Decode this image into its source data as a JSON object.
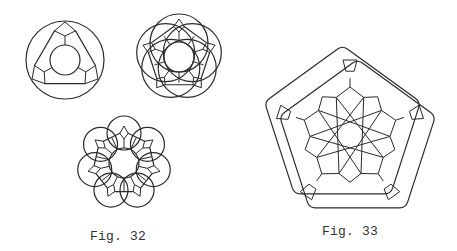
{
  "figures": [
    {
      "id": "fig-32",
      "caption": "Fig. 32",
      "caption_pos": {
        "x": 90,
        "y": 229
      },
      "drawings": [
        {
          "name": "tri-ring",
          "type": "ring",
          "n": 3,
          "cx": 65,
          "cy": 60,
          "outer_r": 39,
          "inner_r": 15,
          "lobe_r": 39,
          "lobe_offset": 0,
          "polygon_r": 33,
          "rotation": -90
        },
        {
          "name": "penta-ring",
          "type": "ring",
          "n": 5,
          "cx": 179,
          "cy": 57,
          "outer_r": 40,
          "inner_r": 15,
          "lobe_r": 29,
          "lobe_offset": 14,
          "polygon_r": 33,
          "rotation": -90
        },
        {
          "name": "hepta-ring",
          "type": "ring",
          "n": 7,
          "cx": 124,
          "cy": 163,
          "outer_r": 45,
          "inner_r": 15,
          "lobe_r": 17,
          "lobe_offset": 30,
          "polygon_r": 32,
          "rotation": -90
        }
      ]
    },
    {
      "id": "fig-33",
      "caption": "Fig. 33",
      "caption_pos": {
        "x": 322,
        "y": 224
      },
      "drawings": [
        {
          "name": "pentagon-star",
          "type": "star-pentagon",
          "cx": 350,
          "cy": 133,
          "outer_r": 82,
          "offset_dx": 11,
          "offset_dy": 9,
          "inner_r": 48,
          "star_r": 40
        }
      ]
    }
  ],
  "colors": {
    "ink": "#2a2a2a",
    "paper": "#ffffff"
  }
}
